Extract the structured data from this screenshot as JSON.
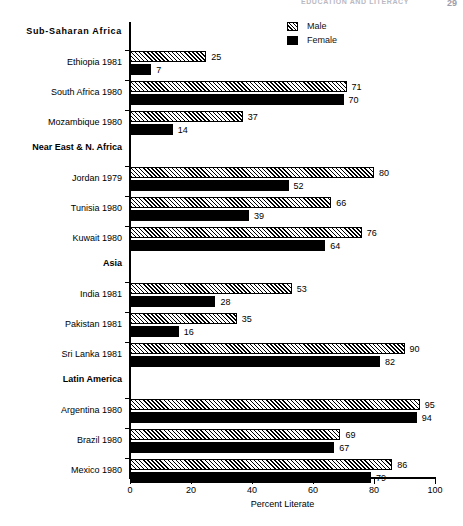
{
  "header": {
    "running_title": "EDUCATION AND LITERACY",
    "page_number": "29"
  },
  "legend": {
    "items": [
      {
        "label": "Male",
        "swatch": "hatched-swatch-icon",
        "color": "#ffffff"
      },
      {
        "label": "Female",
        "swatch": "solid-black-swatch-icon",
        "color": "#000000"
      }
    ]
  },
  "chart_data": {
    "type": "bar",
    "orientation": "horizontal",
    "title": "",
    "xlabel": "Percent Literate",
    "ylabel": "",
    "xlim": [
      0,
      100
    ],
    "xticks": [
      0,
      20,
      40,
      60,
      80,
      100
    ],
    "xtick_labels": [
      "0",
      "20",
      "40",
      "60",
      "80",
      "100"
    ],
    "grid": false,
    "legend_position": "top-right",
    "series": [
      {
        "name": "Male",
        "pattern": "diagonal-hatch"
      },
      {
        "name": "Female",
        "pattern": "solid"
      }
    ],
    "groups": [
      {
        "name": "Sub-Saharan Africa",
        "categories": [
          {
            "label": "Ethiopia 1981",
            "male": 25,
            "female": 7
          },
          {
            "label": "South Africa 1980",
            "male": 71,
            "female": 70
          },
          {
            "label": "Mozambique 1980",
            "male": 37,
            "female": 14
          }
        ]
      },
      {
        "name": "Near East & N. Africa",
        "categories": [
          {
            "label": "Jordan 1979",
            "male": 80,
            "female": 52
          },
          {
            "label": "Tunisia 1980",
            "male": 66,
            "female": 39
          },
          {
            "label": "Kuwait 1980",
            "male": 76,
            "female": 64
          }
        ]
      },
      {
        "name": "Asia",
        "categories": [
          {
            "label": "India 1981",
            "male": 53,
            "female": 28
          },
          {
            "label": "Pakistan 1981",
            "male": 35,
            "female": 16
          },
          {
            "label": "Sri Lanka 1981",
            "male": 90,
            "female": 82
          }
        ]
      },
      {
        "name": "Latin America",
        "categories": [
          {
            "label": "Argentina 1980",
            "male": 95,
            "female": 94
          },
          {
            "label": "Brazil 1980",
            "male": 69,
            "female": 67
          },
          {
            "label": "Mexico 1980",
            "male": 86,
            "female": 79
          }
        ]
      }
    ]
  }
}
